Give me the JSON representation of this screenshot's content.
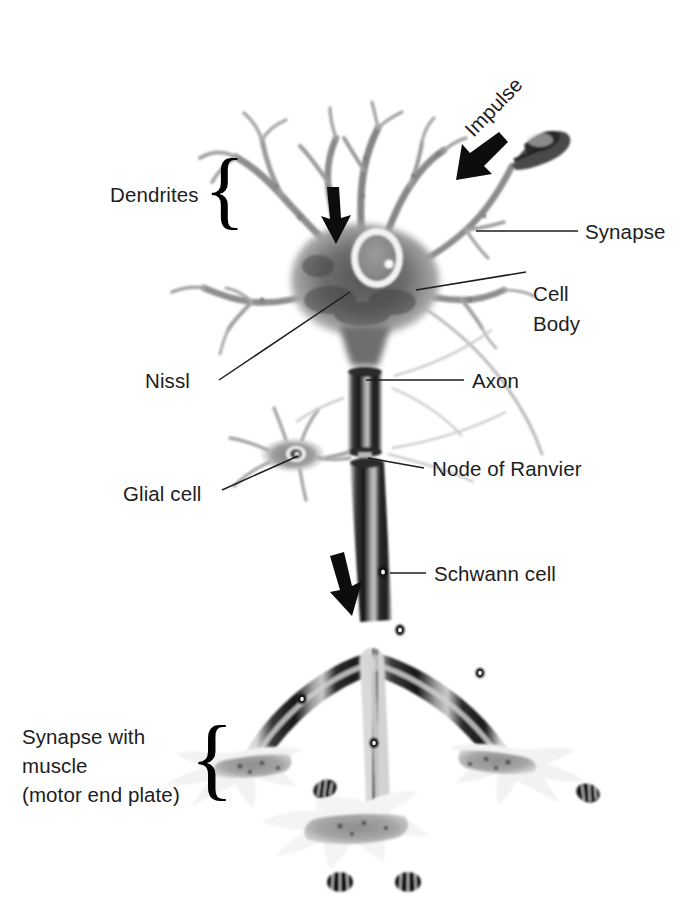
{
  "figure": {
    "type": "biological-illustration",
    "background_color": "#ffffff",
    "ink_color": "#1d1d1d"
  },
  "labels": {
    "dendrites": "Dendrites",
    "impulse": "Impulse",
    "synapse": "Synapse",
    "cell_body_line1": "Cell",
    "cell_body_line2": "Body",
    "nissl": "Nissl",
    "axon": "Axon",
    "node_of_ranvier": "Node of Ranvier",
    "glial_cell": "Glial cell",
    "schwann_cell": "Schwann cell",
    "synapse_muscle_line1": "Synapse with",
    "synapse_muscle_line2": "muscle",
    "synapse_muscle_line3": "(motor end plate)"
  },
  "braces": {
    "dendrites_brace": "{",
    "muscle_brace": "{"
  },
  "annotations": {
    "arrow_dendrite": "down-arrow-icon",
    "arrow_axon": "down-arrow-icon",
    "arrow_impulse": "impulse-arrow-icon"
  },
  "parts": [
    {
      "name": "dendrites",
      "label": "Dendrites"
    },
    {
      "name": "synapse",
      "label": "Synapse"
    },
    {
      "name": "cell-body",
      "label": "Cell Body"
    },
    {
      "name": "nissl",
      "label": "Nissl"
    },
    {
      "name": "axon",
      "label": "Axon"
    },
    {
      "name": "node-of-ranvier",
      "label": "Node of Ranvier"
    },
    {
      "name": "glial-cell",
      "label": "Glial cell"
    },
    {
      "name": "schwann-cell",
      "label": "Schwann cell"
    },
    {
      "name": "motor-end-plate",
      "label": "Synapse with muscle (motor end plate)"
    }
  ]
}
